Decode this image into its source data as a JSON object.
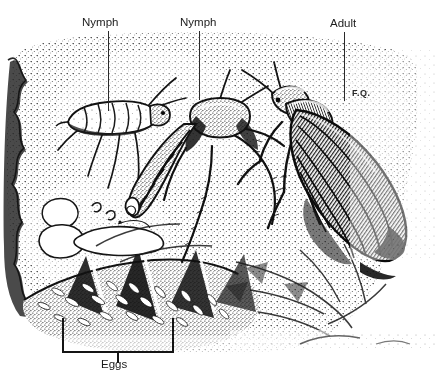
{
  "document": {
    "type": "scientific-illustration",
    "medium": "pen-and-ink stipple drawing",
    "title_partial": "LIFE  CYCLE",
    "signature": "F.Q."
  },
  "labels": {
    "nymph_left": "Nymph",
    "nymph_middle": "Nymph",
    "adult": "Adult",
    "eggs": "Eggs"
  },
  "leaders": [
    {
      "name": "nymph-left-leader",
      "x": 108,
      "y1": 31,
      "y2": 111
    },
    {
      "name": "nymph-middle-leader",
      "x": 199,
      "y1": 31,
      "y2": 100
    },
    {
      "name": "adult-leader",
      "x": 344,
      "y1": 32,
      "y2": 101
    }
  ],
  "bracket": {
    "left": 62,
    "right": 174,
    "top": 318,
    "bottom": 352,
    "stem_x": 118,
    "stem_bottom": 361
  },
  "colors": {
    "ink": "#141414",
    "paper": "#fefefe",
    "stipple": "#2c2c2c",
    "label_text": "#1c1c1c"
  },
  "subjects": [
    {
      "name": "nymph-early-instar",
      "stage": "Nymph",
      "position": "upper-left"
    },
    {
      "name": "nymph-late-instar",
      "stage": "Nymph",
      "position": "center"
    },
    {
      "name": "adult-winged",
      "stage": "Adult",
      "position": "right"
    },
    {
      "name": "egg-mass",
      "stage": "Eggs",
      "position": "lower-left"
    }
  ]
}
